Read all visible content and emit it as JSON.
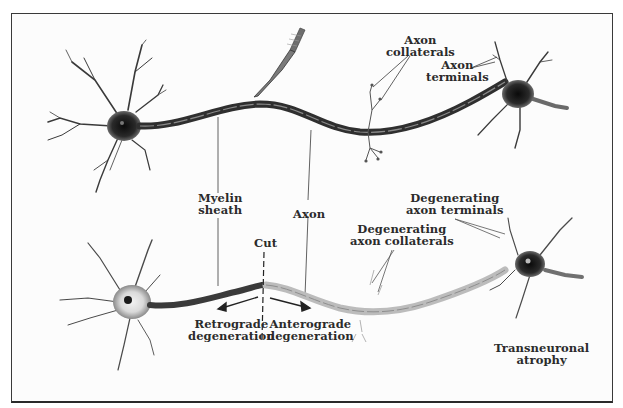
{
  "diagram": {
    "colors": {
      "border": "#3a3a3a",
      "ink": "#2b2b2b",
      "healthy_axon": "#3c3c3c",
      "degenerating_axon": "#b8b8b8",
      "soma": "#1e1e1e"
    },
    "top_panel": {
      "labels": {
        "axon_collaterals": [
          "Axon",
          "collaterals"
        ],
        "axon_terminals": [
          "Axon",
          "terminals"
        ]
      },
      "icons": [
        "scalpel-icon",
        "neuron-left",
        "neuron-right"
      ]
    },
    "shared_labels": {
      "myelin_sheath": [
        "Myelin",
        "sheath"
      ],
      "axon": "Axon"
    },
    "bottom_panel": {
      "labels": {
        "cut": "Cut",
        "retrograde": [
          "Retrograde",
          "degeneration"
        ],
        "anterograde": [
          "Anterograde",
          "degeneration"
        ],
        "degenerating_collaterals": [
          "Degenerating",
          "axon collaterals"
        ],
        "degenerating_terminals": [
          "Degenerating",
          "axon terminals"
        ],
        "transneuronal": [
          "Transneuronal",
          "atrophy"
        ]
      }
    }
  }
}
